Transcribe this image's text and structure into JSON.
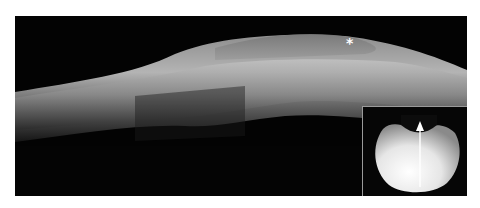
{
  "figure": {
    "annotation_marker": "*",
    "inset_arrow": "up-arrow"
  }
}
